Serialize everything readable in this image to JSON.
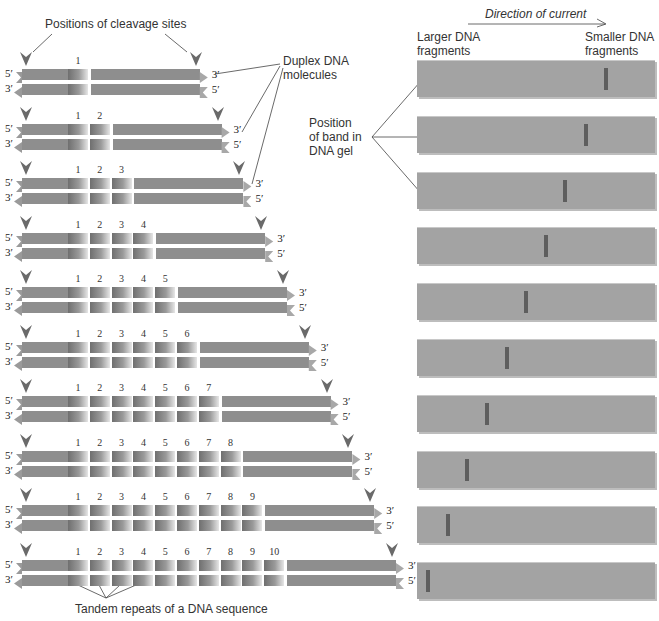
{
  "labels": {
    "cleavage_sites": "Positions of cleavage sites",
    "duplex_dna": "Duplex DNA molecules",
    "duplex_dna_line1": "Duplex DNA",
    "duplex_dna_line2": "molecules",
    "direction": "Direction of current",
    "larger_line1": "Larger DNA",
    "larger_line2": "fragments",
    "smaller_line1": "Smaller DNA",
    "smaller_line2": "fragments",
    "band_line1": "Position",
    "band_line2": "of band in",
    "band_line3": "DNA gel",
    "tandem": "Tandem repeats of a DNA sequence"
  },
  "ends": {
    "five": "5′",
    "three": "3′"
  },
  "molecules": [
    {
      "repeats": 1,
      "numbers": [
        "1"
      ]
    },
    {
      "repeats": 2,
      "numbers": [
        "1",
        "2"
      ]
    },
    {
      "repeats": 3,
      "numbers": [
        "1",
        "2",
        "3"
      ]
    },
    {
      "repeats": 4,
      "numbers": [
        "1",
        "2",
        "3",
        "4"
      ]
    },
    {
      "repeats": 5,
      "numbers": [
        "1",
        "2",
        "3",
        "4",
        "5"
      ]
    },
    {
      "repeats": 6,
      "numbers": [
        "1",
        "2",
        "3",
        "4",
        "5",
        "6"
      ]
    },
    {
      "repeats": 7,
      "numbers": [
        "1",
        "2",
        "3",
        "4",
        "5",
        "6",
        "7"
      ]
    },
    {
      "repeats": 8,
      "numbers": [
        "1",
        "2",
        "3",
        "4",
        "5",
        "6",
        "7",
        "8"
      ]
    },
    {
      "repeats": 9,
      "numbers": [
        "1",
        "2",
        "3",
        "4",
        "5",
        "6",
        "7",
        "8",
        "9"
      ]
    },
    {
      "repeats": 10,
      "numbers": [
        "1",
        "2",
        "3",
        "4",
        "5",
        "6",
        "7",
        "8",
        "9",
        "10"
      ]
    }
  ],
  "gels": [
    {
      "band_x": 604
    },
    {
      "band_x": 584
    },
    {
      "band_x": 563
    },
    {
      "band_x": 544
    },
    {
      "band_x": 524
    },
    {
      "band_x": 505
    },
    {
      "band_x": 485
    },
    {
      "band_x": 465
    },
    {
      "band_x": 446
    },
    {
      "band_x": 426
    }
  ],
  "colors": {
    "strand": "#8e8e8e",
    "gel": "#a3a3a3",
    "band": "#5e5e5e",
    "arrowhead": "#6a6a6a"
  }
}
